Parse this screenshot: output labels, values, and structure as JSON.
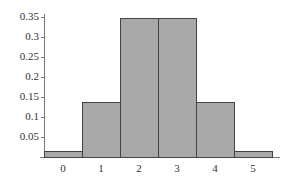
{
  "chart_data": {
    "type": "bar",
    "title": "",
    "xlabel": "",
    "ylabel": "",
    "categories": [
      "0",
      "1",
      "2",
      "3",
      "4",
      "5"
    ],
    "values": [
      0.015,
      0.137,
      0.348,
      0.348,
      0.137,
      0.015
    ],
    "ylim": [
      0,
      0.35
    ],
    "yticks": [
      "0.35",
      "0.3",
      "0.25",
      "0.2",
      "0.15",
      "0.1",
      "0.05"
    ],
    "grid": false,
    "legend": null,
    "bar_color": "#a9a9a9"
  }
}
